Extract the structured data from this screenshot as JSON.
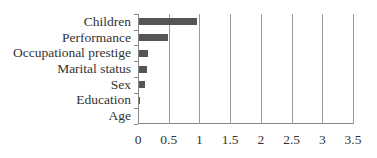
{
  "chart_data": {
    "type": "bar",
    "orientation": "horizontal",
    "title": "",
    "xlabel": "",
    "ylabel": "",
    "categories": [
      "Children",
      "Performance",
      "Occupational prestige",
      "Marital status",
      "Sex",
      "Education",
      "Age"
    ],
    "values": [
      0.95,
      0.47,
      0.15,
      0.13,
      0.1,
      0.02,
      0
    ],
    "xlim": [
      0,
      3.5
    ],
    "xticks": [
      "0",
      "0.5",
      "1",
      "1.5",
      "2",
      "2.5",
      "3",
      "3.5"
    ],
    "grid": "vertical",
    "bar_color": "#555555"
  }
}
